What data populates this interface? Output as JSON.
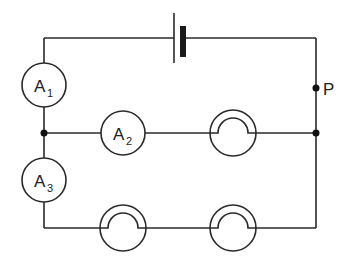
{
  "diagram": {
    "type": "electric-circuit",
    "colors": {
      "line": "#2a2a2a",
      "background": "#ffffff"
    },
    "battery": {
      "label": ""
    },
    "ammeters": [
      {
        "id": "A1",
        "letter": "A",
        "subscript": "1"
      },
      {
        "id": "A2",
        "letter": "A",
        "subscript": "2"
      },
      {
        "id": "A3",
        "letter": "A",
        "subscript": "3"
      }
    ],
    "lamps": [
      {
        "id": "lamp-middle-branch"
      },
      {
        "id": "lamp-bottom-left"
      },
      {
        "id": "lamp-bottom-right"
      }
    ],
    "points": [
      {
        "id": "P",
        "label": "P"
      }
    ]
  }
}
